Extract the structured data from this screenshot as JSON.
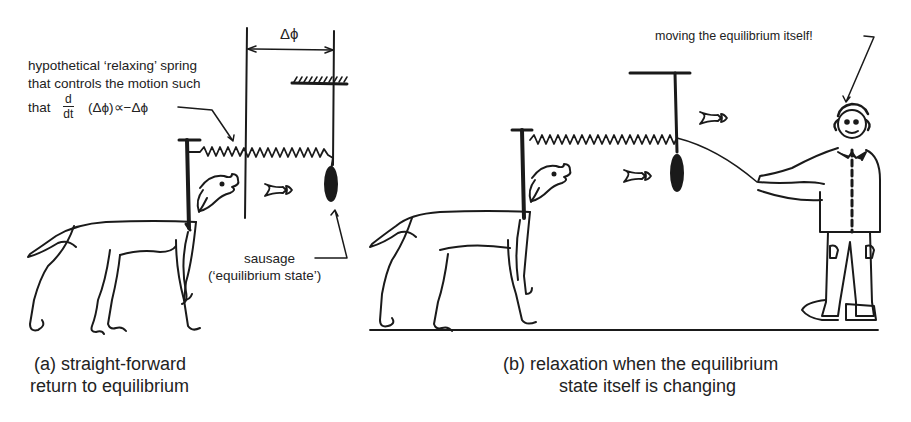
{
  "figure": {
    "panel_a": {
      "caption_line1": "(a) straight-forward",
      "caption_line2": "return to equilibrium",
      "delta_label": "Δϕ",
      "spring_annotation": {
        "line1": "hypothetical ‘relaxing’ spring",
        "line2": "that controls the motion such",
        "line3_prefix": "that",
        "derivative_num": "d",
        "derivative_den": "dt",
        "formula_rest": "(Δϕ)∝−Δϕ"
      },
      "sausage_label_line1": "sausage",
      "sausage_label_line2": "(‘equilibrium state’)"
    },
    "panel_b": {
      "caption_line1": "(b) relaxation when the equilibrium",
      "caption_line2": "state itself is changing",
      "clown_annotation": "moving the equilibrium itself!"
    },
    "icons": [
      "dog-icon",
      "spring-icon",
      "sausage-icon",
      "fish-arrow-icon",
      "clown-icon",
      "hatched-support-icon"
    ],
    "colors": {
      "ink": "#1a1a1a",
      "background": "#ffffff"
    }
  }
}
